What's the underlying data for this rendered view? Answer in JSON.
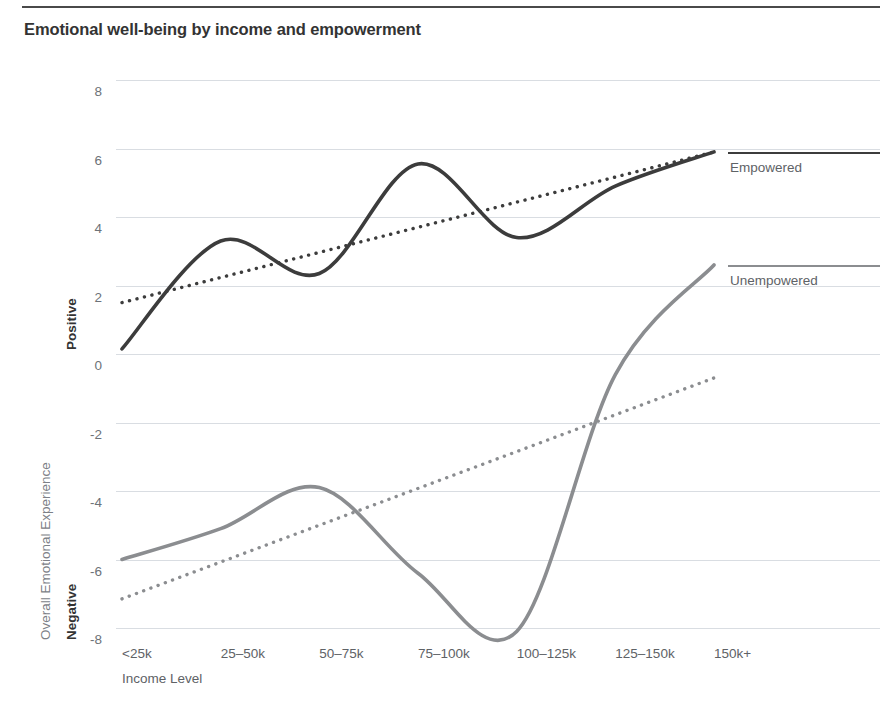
{
  "header": {
    "title": "Emotional well-being by income and empowerment"
  },
  "legend": {
    "position": "right",
    "items": [
      {
        "label": "Empowered",
        "color": "#3c3c3c"
      },
      {
        "label": "Unempowered",
        "color": "#8b8d90"
      }
    ]
  },
  "axes": {
    "x_title": "Income Level",
    "y_title": "Overall Emotional Experience",
    "y_pole_positive": "Positive",
    "y_pole_negative": "Negative"
  },
  "chart_data": {
    "type": "line",
    "title": "Emotional well-being by income and empowerment",
    "xlabel": "Income Level",
    "ylabel": "Overall Emotional Experience",
    "categories": [
      "<25k",
      "25–50k",
      "50–75k",
      "75–100k",
      "100–125k",
      "125–150k",
      "150k+"
    ],
    "ylim": [
      -8,
      8
    ],
    "yticks": [
      8,
      6,
      4,
      2,
      0,
      -2,
      -4,
      -6,
      -8
    ],
    "ytick_labels": [
      "8",
      "6",
      "4",
      "2",
      "0",
      "-2",
      "-4",
      "-6",
      "-8"
    ],
    "grid": true,
    "legend_position": "right",
    "series": [
      {
        "name": "Empowered",
        "color": "#3c3c3c",
        "style": "solid",
        "values": [
          0.15,
          3.3,
          2.35,
          5.55,
          3.4,
          4.9,
          5.9
        ]
      },
      {
        "name": "Empowered trend",
        "color": "#3c3c3c",
        "style": "dotted",
        "trend": true,
        "values": [
          1.5,
          2.25,
          3.0,
          3.75,
          4.5,
          5.2,
          5.9
        ]
      },
      {
        "name": "Unempowered",
        "color": "#8b8d90",
        "style": "solid",
        "values": [
          -6.0,
          -5.1,
          -3.9,
          -6.4,
          -8.1,
          -0.6,
          2.6
        ]
      },
      {
        "name": "Unempowered trend",
        "color": "#8b8d90",
        "style": "dotted",
        "trend": true,
        "values": [
          -7.15,
          -6.05,
          -4.95,
          -3.9,
          -2.8,
          -1.75,
          -0.7
        ]
      }
    ]
  }
}
